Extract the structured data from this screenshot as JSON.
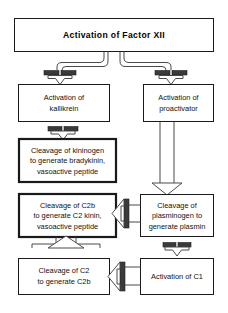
{
  "diagram": {
    "title": "Activation of Factor XII",
    "type": "flowchart",
    "canvas": {
      "width": 228,
      "height": 313
    },
    "colors": {
      "background": "#ffffff",
      "box_border": "#1a1a1a",
      "connector": "#4a4a4a",
      "inhibitor_bar": "#3a3a3a",
      "text": "#111111"
    },
    "nodes": [
      {
        "id": "factor-xii",
        "label": "Activation of Factor XII",
        "lines": [
          "Activation of Factor XII"
        ],
        "emphasis": "title",
        "border": "thin"
      },
      {
        "id": "kallikrein",
        "label": "Activation of kallikrein",
        "lines": [
          "Activation of",
          "kallikrein"
        ],
        "emphasis": "normal",
        "border": "thin"
      },
      {
        "id": "proactivator",
        "label": "Activation of proactivator",
        "lines": [
          "Activation of",
          "proactivator"
        ],
        "emphasis": "normal",
        "border": "thin"
      },
      {
        "id": "kininogen",
        "label": "Cleavage of kininogen to generate bradykinin, vasoactive peptide",
        "lines": [
          "Cleavage of kininogen",
          "to generate bradykinin,",
          "vasoactive peptide"
        ],
        "emphasis": "highlighted",
        "border": "thick"
      },
      {
        "id": "c2b-kinin",
        "label": "Cleavage of C2b to generate C2 kinin, vasoactive peptide",
        "lines": [
          "Cleavage of C2b",
          "to generate C2 kinin,",
          "vasoactive peptide"
        ],
        "emphasis": "highlighted",
        "border": "thick"
      },
      {
        "id": "plasminogen",
        "label": "Cleavage of plasminogen to generate plasmin",
        "lines": [
          "Cleavage of",
          "plasminogen to",
          "generate plasmin"
        ],
        "emphasis": "normal",
        "border": "thin"
      },
      {
        "id": "cleavage-c2",
        "label": "Cleavage of C2 to generate C2b",
        "lines": [
          "Cleavage of C2",
          "to generate C2b"
        ],
        "emphasis": "normal",
        "border": "thin"
      },
      {
        "id": "activation-c1",
        "label": "Activation of C1",
        "lines": [
          "Activation of C1"
        ],
        "emphasis": "normal",
        "border": "thin"
      }
    ],
    "edges": [
      {
        "id": "edge-xii-kallikrein",
        "from": "factor-xii",
        "to": "kallikrein",
        "marker": "bar-arrow-down"
      },
      {
        "id": "edge-xii-proactivator",
        "from": "factor-xii",
        "to": "proactivator",
        "marker": "bar-arrow-down"
      },
      {
        "id": "edge-kallikrein-kininogen",
        "from": "kallikrein",
        "to": "kininogen",
        "marker": "bar-arrow-down"
      },
      {
        "id": "edge-proactivator-plasminogen",
        "from": "proactivator",
        "to": "plasminogen",
        "marker": "arrow-down"
      },
      {
        "id": "edge-plasminogen-c2bkinin",
        "from": "plasminogen",
        "to": "c2b-kinin",
        "marker": "bar-arrow-left"
      },
      {
        "id": "edge-plasminogen-c1",
        "from": "plasminogen",
        "to": "activation-c1",
        "marker": "bar-arrow-down"
      },
      {
        "id": "edge-c1-cleavagec2",
        "from": "activation-c1",
        "to": "cleavage-c2",
        "marker": "bar-arrow-left"
      },
      {
        "id": "edge-cleavagec2-c2bkinin",
        "from": "cleavage-c2",
        "to": "c2b-kinin",
        "marker": "arrow-up"
      }
    ]
  }
}
